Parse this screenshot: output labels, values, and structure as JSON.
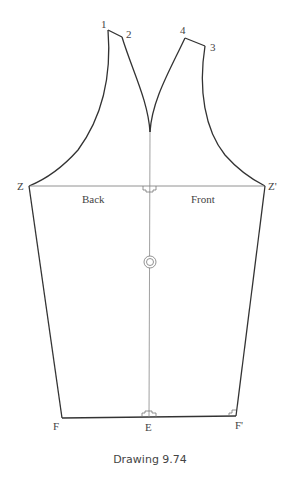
{
  "diagram": {
    "caption": "Drawing 9.74",
    "labels": {
      "p1": "1",
      "p2": "2",
      "p3": "3",
      "p4": "4",
      "z": "Z",
      "z_prime": "Z'",
      "back": "Back",
      "front": "Front",
      "f": "F",
      "e": "E",
      "f_prime": "F'"
    },
    "colors": {
      "outline": "#333333",
      "guide": "#777777",
      "text": "#444444"
    }
  }
}
